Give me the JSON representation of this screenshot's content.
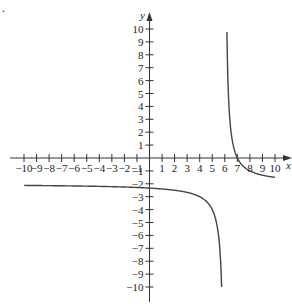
{
  "chart_data": {
    "type": "line",
    "title": "",
    "xlabel": "x",
    "ylabel": "y",
    "xlim": [
      -10,
      10
    ],
    "ylim": [
      -10,
      10
    ],
    "grid": false,
    "legend": null,
    "x_ticks": [
      -10,
      -9,
      -8,
      -7,
      -6,
      -5,
      -4,
      -3,
      -2,
      -1,
      1,
      2,
      3,
      4,
      5,
      6,
      7,
      8,
      9,
      10
    ],
    "y_ticks": [
      -10,
      -9,
      -8,
      -7,
      -6,
      -5,
      -4,
      -3,
      -2,
      -1,
      1,
      2,
      3,
      4,
      5,
      6,
      7,
      8,
      9,
      10
    ],
    "x_tick_labels": [
      "−10",
      "−9",
      "−8",
      "−7",
      "−6",
      "−5",
      "−4",
      "−3",
      "−2",
      "−1",
      "1",
      "2",
      "3",
      "4",
      "5",
      "6",
      "7",
      "8",
      "9",
      "10"
    ],
    "y_tick_labels": [
      "−10",
      "−9",
      "−8",
      "−7",
      "−6",
      "−5",
      "−4",
      "−3",
      "−2",
      "−1",
      "1",
      "2",
      "3",
      "4",
      "5",
      "6",
      "7",
      "8",
      "9",
      "10"
    ],
    "annotations": [
      "."
    ],
    "series": [
      {
        "name": "left-branch",
        "x": [
          -10,
          -8,
          -6,
          -4,
          -2,
          0,
          2,
          3,
          4,
          4.5,
          5,
          5.3,
          5.5,
          5.65,
          5.75
        ],
        "y": [
          -2.13,
          -2.14,
          -2.17,
          -2.2,
          -2.25,
          -2.33,
          -2.5,
          -2.67,
          -3.0,
          -3.33,
          -4.0,
          -4.86,
          -6.0,
          -7.71,
          -10.0
        ]
      },
      {
        "name": "right-branch",
        "x": [
          6.17,
          6.2,
          6.25,
          6.33,
          6.5,
          6.75,
          7,
          7.5,
          8,
          8.5,
          9,
          9.5,
          10
        ],
        "y": [
          9.76,
          8.0,
          6.0,
          4.06,
          2.0,
          0.67,
          0.0,
          -0.67,
          -1.0,
          -1.2,
          -1.33,
          -1.43,
          -1.5
        ]
      }
    ],
    "asymptotes": {
      "vertical": 6,
      "horizontal": -2
    }
  },
  "figure": {
    "stray_mark": "."
  }
}
